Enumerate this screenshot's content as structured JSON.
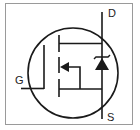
{
  "diagram": {
    "type": "schematic-symbol",
    "component": "N-channel MOSFET with body diode",
    "terminals": {
      "drain": "D",
      "source": "S",
      "gate": "G"
    },
    "colors": {
      "stroke": "#1a1a1a",
      "frame": "#9a9a9a",
      "background": "#ffffff"
    }
  }
}
